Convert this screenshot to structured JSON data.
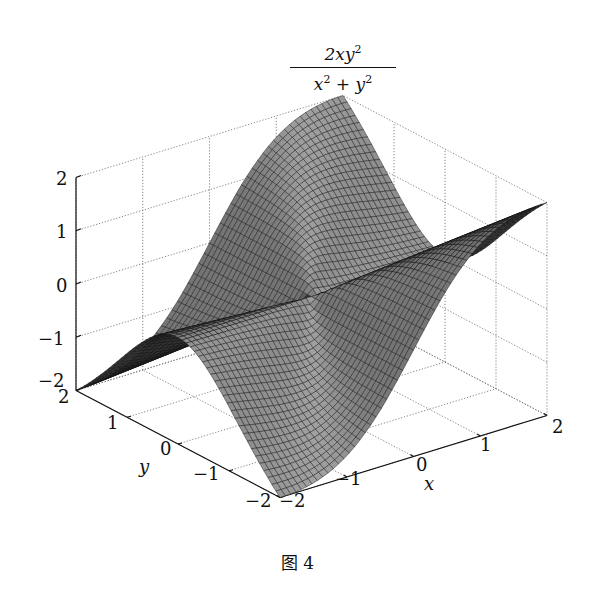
{
  "chart_data": {
    "type": "surface3d",
    "title_parts": {
      "numerator": "2xy",
      "numerator_exp": "2",
      "denominator_a": "x",
      "denominator_a_exp": "2",
      "plus": "+",
      "denominator_b": "y",
      "denominator_b_exp": "2"
    },
    "function": "z = 2*x*y^2/(x^2+y^2)",
    "xlabel": "x",
    "ylabel": "y",
    "zlabel": "",
    "xlim": [
      -2,
      2
    ],
    "ylim": [
      -2,
      2
    ],
    "zlim": [
      -2,
      2
    ],
    "x_ticks": [
      "−2",
      "−1",
      "0",
      "1",
      "2"
    ],
    "y_ticks": [
      "−2",
      "−1",
      "0",
      "1",
      "2"
    ],
    "z_ticks": [
      "−2",
      "−1",
      "0",
      "1",
      "2"
    ],
    "grid": true,
    "grid_style": "dotted",
    "mesh_resolution": 50,
    "colormap": "grayscale",
    "sample_points": [
      {
        "x": -2,
        "y": -2,
        "z": -2
      },
      {
        "x": 2,
        "y": -2,
        "z": 2
      },
      {
        "x": -2,
        "y": 2,
        "z": -2
      },
      {
        "x": 2,
        "y": 2,
        "z": 2
      },
      {
        "x": 0,
        "y": 0,
        "z": 0
      },
      {
        "x": 2,
        "y": 0,
        "z": 0
      },
      {
        "x": -2,
        "y": 0,
        "z": 0
      }
    ]
  },
  "figure": {
    "caption": "图 4"
  },
  "colors": {
    "surface_light": "#9a9a9a",
    "surface_dark": "#1a1a1a",
    "mesh_line": "#111111",
    "grid": "#666666",
    "axis": "#111111",
    "background": "#ffffff"
  }
}
